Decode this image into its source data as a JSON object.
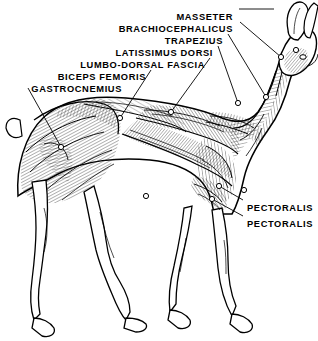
{
  "figure": {
    "view": "left lateral",
    "background_color": "#ffffff",
    "ink_color": "#000000",
    "width": 318,
    "height": 341
  },
  "labels": {
    "left_group": [
      {
        "text": "MASSETER",
        "x": 233,
        "y": 12,
        "anchor": "right"
      },
      {
        "text": "BRACHIOCEPHALICUS",
        "x": 233,
        "y": 24,
        "anchor": "right"
      },
      {
        "text": "TRAPEZIUS",
        "x": 223,
        "y": 36,
        "anchor": "right"
      },
      {
        "text": "LATISSIMUS DORSI",
        "x": 213,
        "y": 48,
        "anchor": "right"
      },
      {
        "text": "LUMBO-DORSAL FASCIA",
        "x": 205,
        "y": 60,
        "anchor": "right"
      },
      {
        "text": "BICEPS FEMORIS",
        "x": 146,
        "y": 72,
        "anchor": "right"
      },
      {
        "text": "GASTROCNEMIUS",
        "x": 122,
        "y": 84,
        "anchor": "right"
      }
    ],
    "right_group": [
      {
        "text": "PECTORALIS",
        "x": 247,
        "y": 203,
        "anchor": "left"
      },
      {
        "text": "PECTORALIS",
        "x": 247,
        "y": 219,
        "anchor": "left"
      }
    ]
  },
  "leaders": [
    {
      "name": "masseter-leader",
      "from": [
        239,
        9
      ],
      "to": [
        274,
        9
      ],
      "dash": true,
      "marker": false
    },
    {
      "name": "brachiocephalicus-leader",
      "from": [
        240,
        22
      ],
      "to": [
        281,
        57
      ],
      "dash": false,
      "marker": true
    },
    {
      "name": "trapezius-leader",
      "from": [
        228,
        34
      ],
      "to": [
        266,
        97
      ],
      "dash": false,
      "marker": true
    },
    {
      "name": "latissimus-dorsi-leader",
      "from": [
        218,
        46
      ],
      "to": [
        238,
        103
      ],
      "dash": false,
      "marker": true
    },
    {
      "name": "lumbo-dorsal-fascia-leader",
      "from": [
        210,
        58
      ],
      "to": [
        171,
        112
      ],
      "dash": false,
      "marker": true
    },
    {
      "name": "biceps-femoris-leader",
      "from": [
        151,
        70
      ],
      "to": [
        120,
        118
      ],
      "dash": false,
      "marker": true
    },
    {
      "name": "gastrocnemius-leader",
      "from": [
        28,
        88
      ],
      "to": [
        61,
        147
      ],
      "dash": false,
      "marker": true
    },
    {
      "name": "pectoralis-upper-leader",
      "from": [
        243,
        200
      ],
      "to": [
        219,
        186
      ],
      "dash": false,
      "marker": true
    },
    {
      "name": "pectoralis-lower-leader",
      "from": [
        243,
        216
      ],
      "to": [
        212,
        199
      ],
      "dash": false,
      "marker": true
    }
  ],
  "callout_markers": [
    {
      "name": "marker-masseter-head",
      "x": 296,
      "y": 50
    },
    {
      "name": "marker-brachiocephalicus",
      "x": 281,
      "y": 57
    },
    {
      "name": "marker-trapezius",
      "x": 266,
      "y": 97
    },
    {
      "name": "marker-latissimus-dorsi",
      "x": 238,
      "y": 103
    },
    {
      "name": "marker-lumbo-dorsal-fascia",
      "x": 171,
      "y": 112
    },
    {
      "name": "marker-biceps-femoris",
      "x": 120,
      "y": 118
    },
    {
      "name": "marker-gastrocnemius",
      "x": 61,
      "y": 147
    },
    {
      "name": "marker-pectoralis-upper",
      "x": 219,
      "y": 186
    },
    {
      "name": "marker-pectoralis-lower",
      "x": 212,
      "y": 199
    },
    {
      "name": "marker-flank",
      "x": 146,
      "y": 196
    },
    {
      "name": "marker-shoulder",
      "x": 244,
      "y": 190
    }
  ]
}
